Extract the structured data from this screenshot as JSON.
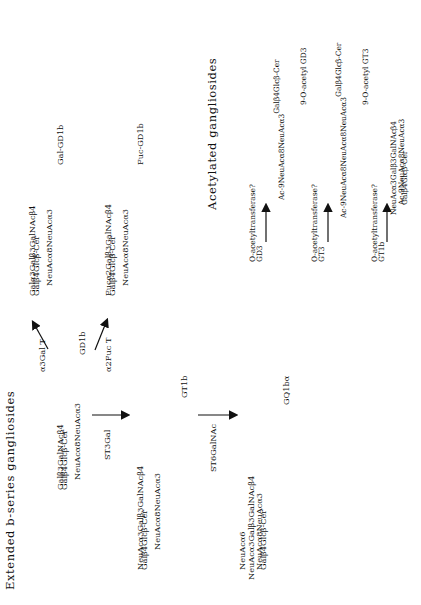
{
  "headings": {
    "extended": "Extended b-series gangliosides",
    "acetylated": "Acetylated gangliosides"
  },
  "gd1b": {
    "line1_a": "Galβ3GalNAcβ4",
    "line1_b": "Galβ4Glcβ-Cer",
    "line2": "NeuAcα8NeuAcα3",
    "name": "GD1b"
  },
  "gal_gd1b": {
    "line1_a": "Galα3Galβ3GalNAcβ4",
    "line1_b": "Galβ4Glcβ-Cer",
    "line2": "NeuAcα8NeuAcα3",
    "name": "Gal-GD1b",
    "enzyme": "α3Gal T"
  },
  "fuc_gd1b": {
    "line1_a": "Fucα2Galβ3GalNAcβ4",
    "line1_b": "Galβ4Glcβ-Cer",
    "line2": "NeuAcα8NeuAcα3",
    "name": "Fuc-GD1b",
    "enzyme": "α2Fuc T"
  },
  "gt1b": {
    "enzyme": "ST3Gal",
    "line1_a": "NeuAcα3Galβ3GalNAcβ4",
    "line1_b": "Galβ4Glcβ-Cer",
    "line2": "NeuAcα8NeuAcα3",
    "name": "GT1b"
  },
  "gq1ba": {
    "enzyme": "ST6GalNAc",
    "line0": "NeuAcα6",
    "line1": "NeuAcα3Galβ3GalNAcβ4",
    "line2_a": "NeuAcα8NeuAcα3",
    "line2_b": "Galβ4Glcβ-Cer",
    "name": "GQ1bα"
  },
  "acetyl": [
    {
      "source": "GD3",
      "enzyme": "O-acetyltransferase?",
      "line1_a": "Ac-9NeuAcα8NeuAcα3",
      "line1_b": "Galβ4Glcβ-Cer",
      "name": "9-O-acetyl GD3"
    },
    {
      "source": "GT3",
      "enzyme": "O-acetyltransferase?",
      "line1_a": "Ac-9NeuAcα8NeuAcα8NeuAcα3",
      "line1_b": "Galβ4Glcβ-Cer",
      "name": "9-O-acetyl GT3"
    },
    {
      "source": "GT1b",
      "enzyme": "O-acetyltransferase?",
      "line1": "NeuAcα3Galβ3GalNAcβ4",
      "line2_a": "Ac-9NeuAcα8NeuAcα3",
      "line2_b": "Galβ4Glcβ-Cer"
    }
  ]
}
